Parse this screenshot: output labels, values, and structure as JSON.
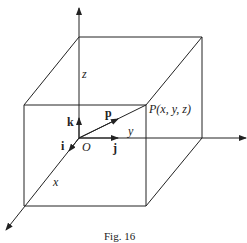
{
  "figure": {
    "caption": "Fig. 16",
    "axes": {
      "x": "x",
      "y": "y",
      "z": "z"
    },
    "origin_label": "O",
    "unit_vectors": {
      "i": "i",
      "j": "j",
      "k": "k"
    },
    "position_vector": "p",
    "point_label": "P(x, y, z)",
    "colors": {
      "line": "#222222",
      "background": "#ffffff"
    }
  }
}
